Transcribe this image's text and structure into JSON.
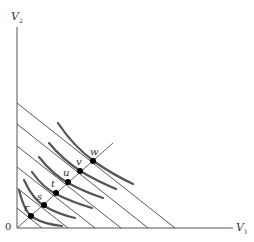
{
  "diagram": {
    "axes": {
      "y_label": "V",
      "y_sub": "2",
      "x_label": "V",
      "x_sub": "1",
      "origin_label": "0"
    },
    "points": [
      {
        "label": "r",
        "x": 31,
        "y": 216
      },
      {
        "label": "s",
        "x": 44,
        "y": 205
      },
      {
        "label": "t",
        "x": 56,
        "y": 193
      },
      {
        "label": "u",
        "x": 68,
        "y": 182
      },
      {
        "label": "v",
        "x": 80,
        "y": 171
      },
      {
        "label": "w",
        "x": 93,
        "y": 161
      }
    ],
    "budget_lines_count": 6,
    "colors": {
      "axis": "#555555",
      "line": "#444444",
      "curve": "#555555",
      "point": "#000000"
    }
  }
}
